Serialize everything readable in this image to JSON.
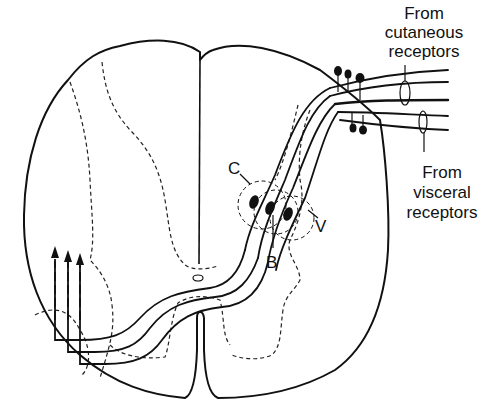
{
  "figure": {
    "labels": {
      "cutaneous": [
        "From",
        "cutaneous",
        "receptors"
      ],
      "visceral": [
        "From",
        "visceral",
        "receptors"
      ],
      "neuron_c": "C",
      "neuron_b": "B",
      "neuron_v": "V"
    },
    "colors": {
      "ink": "#111111",
      "background": "#ffffff"
    }
  }
}
